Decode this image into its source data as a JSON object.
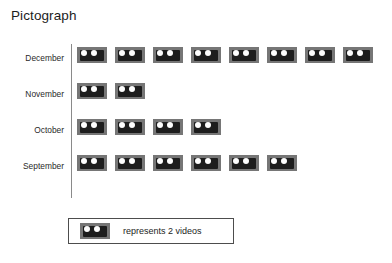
{
  "chart_data": {
    "type": "pictograph",
    "title": "Pictograph",
    "xlabel": "",
    "ylabel": "",
    "categories": [
      "December",
      "November",
      "October",
      "September"
    ],
    "icon_counts": [
      8,
      2,
      4,
      6
    ],
    "icon_unit_value": 2,
    "values": [
      16,
      4,
      8,
      12
    ],
    "unit_name": "videos",
    "legend": {
      "icon_name": "video-cassette-icon",
      "text": "represents 2 videos"
    },
    "axis": {
      "vertical_line": true,
      "grid": false
    },
    "colors": {
      "icon_body": "#767676",
      "icon_window": "#1d1d1d",
      "icon_reel": "#fdfdfd",
      "axis_line": "#8a8a8a",
      "legend_border": "#4d4d4d",
      "text": "#1c1c1c",
      "background": "#ffffff"
    },
    "rows": [
      {
        "label": "December",
        "icons": 8,
        "value": 16
      },
      {
        "label": "November",
        "icons": 2,
        "value": 4
      },
      {
        "label": "October",
        "icons": 4,
        "value": 8
      },
      {
        "label": "September",
        "icons": 6,
        "value": 12
      }
    ]
  }
}
